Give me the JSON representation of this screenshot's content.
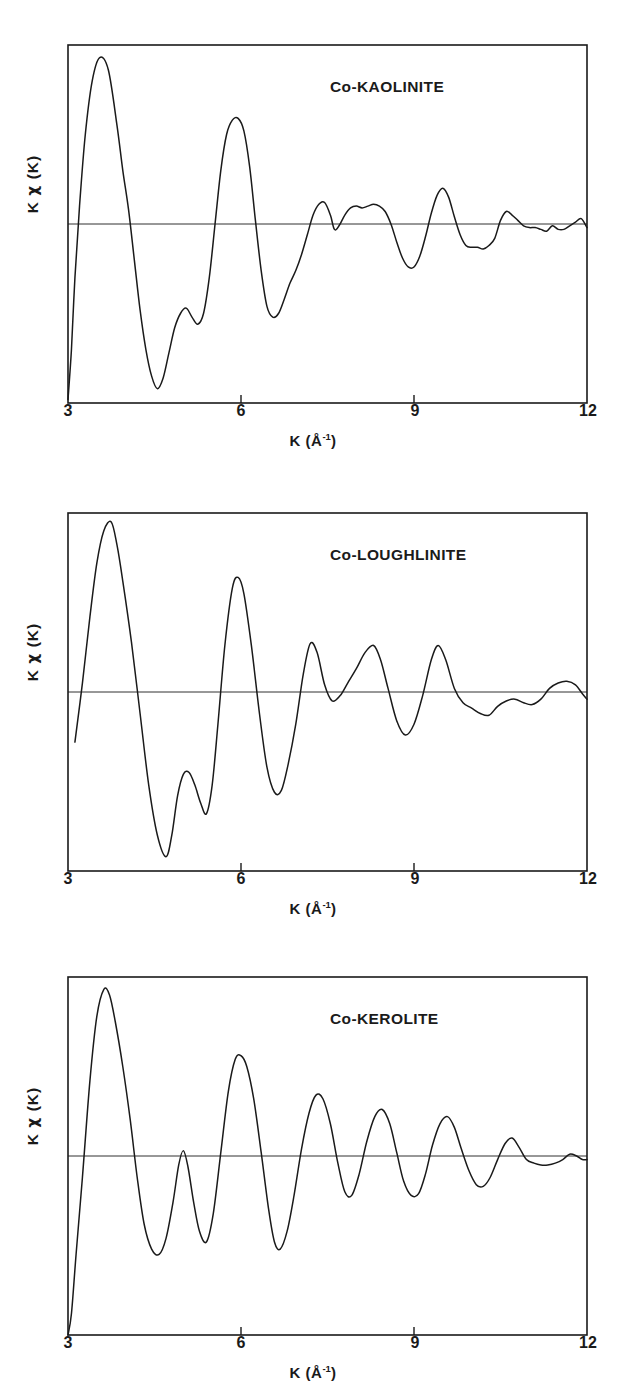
{
  "figure": {
    "panel_count": 3,
    "background_color": "#ffffff",
    "line_color": "#1a1a1a"
  },
  "axes": {
    "xlabel_prefix": "K (Å",
    "xlabel_exponent": "-1",
    "xlabel_suffix": ")",
    "xlabel_full": "K (Å-1)",
    "ylabel_k": "K",
    "ylabel_chi": "χ",
    "ylabel_paren": "(K)",
    "ylabel_full": "K χ (K)",
    "xticks": [
      "3",
      "6",
      "9",
      "12"
    ],
    "xtick_values": [
      3,
      6,
      9,
      12
    ]
  },
  "panels": [
    {
      "id": "panel-kaolinite",
      "title": "Co-KAOLINITE",
      "xlabel_prefix": "K (Å",
      "xlabel_exponent": "-1",
      "xlabel_suffix": ")",
      "ylabel_k": "K",
      "ylabel_chi": "χ",
      "ylabel_paren": "(K)",
      "xticks": [
        "3",
        "6",
        "9",
        "12"
      ]
    },
    {
      "id": "panel-loughlinite",
      "title": "Co-LOUGHLINITE",
      "xlabel_prefix": "K (Å",
      "xlabel_exponent": "-1",
      "xlabel_suffix": ")",
      "ylabel_k": "K",
      "ylabel_chi": "χ",
      "ylabel_paren": "(K)",
      "xticks": [
        "3",
        "6",
        "9",
        "12"
      ]
    },
    {
      "id": "panel-kerolite",
      "title": "Co-KEROLITE",
      "xlabel_prefix": "K (Å",
      "xlabel_exponent": "-1",
      "xlabel_suffix": ")",
      "ylabel_k": "K",
      "ylabel_chi": "χ",
      "ylabel_paren": "(K)",
      "xticks": [
        "3",
        "6",
        "9",
        "12"
      ]
    }
  ],
  "chart_data": [
    {
      "type": "line",
      "title": "Co-KAOLINITE",
      "xlabel": "K (Å-1)",
      "ylabel": "K χ (K)",
      "xlim": [
        3,
        12
      ],
      "ylim": [
        -1.0,
        1.0
      ],
      "grid": false,
      "legend": null,
      "zero_line": 0,
      "x": [
        3.0,
        3.06,
        3.12,
        3.2,
        3.3,
        3.42,
        3.55,
        3.7,
        3.85,
        3.95,
        4.05,
        4.15,
        4.25,
        4.35,
        4.45,
        4.55,
        4.65,
        4.75,
        4.85,
        4.95,
        5.05,
        5.15,
        5.25,
        5.35,
        5.45,
        5.55,
        5.65,
        5.75,
        5.85,
        5.95,
        6.05,
        6.15,
        6.25,
        6.35,
        6.45,
        6.55,
        6.65,
        6.75,
        6.85,
        6.95,
        7.05,
        7.15,
        7.25,
        7.35,
        7.45,
        7.55,
        7.62,
        7.7,
        7.8,
        7.9,
        8.0,
        8.1,
        8.2,
        8.3,
        8.4,
        8.5,
        8.6,
        8.7,
        8.8,
        8.9,
        9.0,
        9.1,
        9.2,
        9.3,
        9.4,
        9.5,
        9.6,
        9.7,
        9.8,
        9.9,
        10.0,
        10.1,
        10.2,
        10.3,
        10.4,
        10.5,
        10.6,
        10.7,
        10.8,
        10.9,
        11.0,
        11.1,
        11.2,
        11.3,
        11.4,
        11.5,
        11.6,
        11.7,
        11.8,
        11.9,
        12.0
      ],
      "y": [
        -0.98,
        -0.7,
        -0.3,
        0.1,
        0.5,
        0.8,
        0.93,
        0.86,
        0.55,
        0.3,
        0.08,
        -0.2,
        -0.48,
        -0.7,
        -0.85,
        -0.92,
        -0.86,
        -0.72,
        -0.58,
        -0.5,
        -0.47,
        -0.52,
        -0.56,
        -0.5,
        -0.3,
        0.0,
        0.3,
        0.5,
        0.58,
        0.59,
        0.52,
        0.32,
        0.02,
        -0.26,
        -0.46,
        -0.52,
        -0.5,
        -0.42,
        -0.33,
        -0.26,
        -0.17,
        -0.06,
        0.05,
        0.11,
        0.12,
        0.05,
        -0.03,
        -0.01,
        0.05,
        0.09,
        0.1,
        0.09,
        0.1,
        0.11,
        0.1,
        0.07,
        0.0,
        -0.1,
        -0.19,
        -0.24,
        -0.24,
        -0.18,
        -0.07,
        0.06,
        0.16,
        0.2,
        0.15,
        0.04,
        -0.06,
        -0.12,
        -0.13,
        -0.13,
        -0.14,
        -0.12,
        -0.08,
        0.02,
        0.07,
        0.05,
        0.02,
        -0.01,
        -0.02,
        -0.02,
        -0.03,
        -0.04,
        -0.01,
        -0.03,
        -0.03,
        -0.01,
        0.01,
        0.03,
        -0.02
      ]
    },
    {
      "type": "line",
      "title": "Co-LOUGHLINITE",
      "xlabel": "K (Å-1)",
      "ylabel": "K χ (K)",
      "xlim": [
        3,
        12
      ],
      "ylim": [
        -1.0,
        1.0
      ],
      "grid": false,
      "legend": null,
      "zero_line": 0,
      "x": [
        3.12,
        3.25,
        3.38,
        3.5,
        3.62,
        3.75,
        3.85,
        3.95,
        4.1,
        4.25,
        4.4,
        4.55,
        4.7,
        4.8,
        4.9,
        5.0,
        5.1,
        5.2,
        5.3,
        5.4,
        5.5,
        5.6,
        5.72,
        5.85,
        5.95,
        6.05,
        6.18,
        6.32,
        6.45,
        6.58,
        6.7,
        6.82,
        6.95,
        7.08,
        7.2,
        7.32,
        7.45,
        7.58,
        7.72,
        7.85,
        8.0,
        8.15,
        8.3,
        8.42,
        8.55,
        8.7,
        8.85,
        9.0,
        9.15,
        9.3,
        9.42,
        9.55,
        9.7,
        9.85,
        10.0,
        10.15,
        10.3,
        10.45,
        10.6,
        10.75,
        10.9,
        11.05,
        11.2,
        11.35,
        11.5,
        11.65,
        11.8,
        11.92,
        12.0
      ],
      "y": [
        -0.28,
        0.05,
        0.42,
        0.72,
        0.9,
        0.95,
        0.82,
        0.62,
        0.28,
        -0.12,
        -0.52,
        -0.8,
        -0.92,
        -0.8,
        -0.58,
        -0.46,
        -0.45,
        -0.52,
        -0.62,
        -0.68,
        -0.52,
        -0.18,
        0.26,
        0.58,
        0.64,
        0.55,
        0.26,
        -0.12,
        -0.42,
        -0.56,
        -0.55,
        -0.4,
        -0.18,
        0.1,
        0.27,
        0.22,
        0.04,
        -0.05,
        -0.02,
        0.05,
        0.13,
        0.22,
        0.26,
        0.18,
        0.02,
        -0.16,
        -0.24,
        -0.18,
        -0.02,
        0.18,
        0.26,
        0.18,
        0.02,
        -0.06,
        -0.09,
        -0.12,
        -0.13,
        -0.08,
        -0.05,
        -0.04,
        -0.06,
        -0.07,
        -0.04,
        0.02,
        0.05,
        0.06,
        0.04,
        -0.01,
        -0.04
      ]
    },
    {
      "type": "line",
      "title": "Co-KEROLITE",
      "xlabel": "K (Å-1)",
      "ylabel": "K χ (K)",
      "xlim": [
        3,
        12
      ],
      "ylim": [
        -1.0,
        1.0
      ],
      "grid": false,
      "legend": null,
      "zero_line": 0,
      "x": [
        3.0,
        3.06,
        3.14,
        3.25,
        3.38,
        3.5,
        3.62,
        3.72,
        3.82,
        3.95,
        4.08,
        4.2,
        4.32,
        4.45,
        4.58,
        4.7,
        4.82,
        4.92,
        5.0,
        5.08,
        5.18,
        5.28,
        5.4,
        5.52,
        5.65,
        5.78,
        5.9,
        6.0,
        6.1,
        6.22,
        6.35,
        6.48,
        6.58,
        6.68,
        6.8,
        6.92,
        7.05,
        7.18,
        7.3,
        7.42,
        7.55,
        7.68,
        7.8,
        7.92,
        8.05,
        8.18,
        8.32,
        8.45,
        8.58,
        8.7,
        8.82,
        8.95,
        9.08,
        9.2,
        9.32,
        9.45,
        9.58,
        9.7,
        9.82,
        9.95,
        10.08,
        10.2,
        10.32,
        10.45,
        10.58,
        10.7,
        10.82,
        10.95,
        11.08,
        11.2,
        11.32,
        11.45,
        11.58,
        11.7,
        11.82,
        11.92,
        12.0
      ],
      "y": [
        -1.0,
        -0.88,
        -0.55,
        -0.12,
        0.42,
        0.78,
        0.93,
        0.9,
        0.75,
        0.5,
        0.2,
        -0.12,
        -0.38,
        -0.52,
        -0.55,
        -0.46,
        -0.26,
        -0.05,
        0.03,
        -0.06,
        -0.26,
        -0.42,
        -0.48,
        -0.32,
        0.02,
        0.36,
        0.54,
        0.56,
        0.5,
        0.32,
        0.02,
        -0.3,
        -0.48,
        -0.52,
        -0.42,
        -0.22,
        0.04,
        0.24,
        0.34,
        0.32,
        0.18,
        -0.04,
        -0.2,
        -0.22,
        -0.1,
        0.08,
        0.22,
        0.26,
        0.18,
        0.02,
        -0.14,
        -0.22,
        -0.21,
        -0.1,
        0.06,
        0.18,
        0.22,
        0.16,
        0.04,
        -0.08,
        -0.16,
        -0.17,
        -0.12,
        -0.02,
        0.07,
        0.1,
        0.05,
        -0.02,
        -0.04,
        -0.05,
        -0.05,
        -0.04,
        -0.02,
        0.01,
        0.0,
        -0.02,
        -0.02
      ]
    }
  ]
}
